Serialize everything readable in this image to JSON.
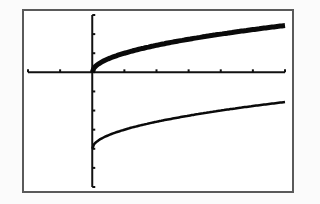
{
  "chart_data": {
    "type": "line",
    "title": "",
    "xlabel": "",
    "ylabel": "",
    "xlim": [
      -2,
      6
    ],
    "ylim": [
      -6,
      3
    ],
    "xscale": 1,
    "yscale": 1,
    "grid": false,
    "legend": null,
    "series": [
      {
        "name": "y1 = sqrt(x)",
        "style": "thick",
        "x": [
          0,
          0.25,
          0.5,
          1,
          1.5,
          2,
          2.5,
          3,
          3.5,
          4,
          4.5,
          5,
          5.5,
          6
        ],
        "values": [
          0,
          0.5,
          0.71,
          1,
          1.22,
          1.41,
          1.58,
          1.73,
          1.87,
          2,
          2.12,
          2.24,
          2.35,
          2.45
        ]
      },
      {
        "name": "y2 = sqrt(x) - 4",
        "style": "thin",
        "x": [
          0,
          0.25,
          0.5,
          1,
          1.5,
          2,
          2.5,
          3,
          3.5,
          4,
          4.5,
          5,
          5.5,
          6
        ],
        "values": [
          -4,
          -3.5,
          -3.29,
          -3,
          -2.78,
          -2.59,
          -2.42,
          -2.27,
          -2.13,
          -2,
          -1.88,
          -1.76,
          -1.65,
          -1.55
        ]
      }
    ]
  },
  "screen": {
    "label": "graphing calculator screen"
  }
}
